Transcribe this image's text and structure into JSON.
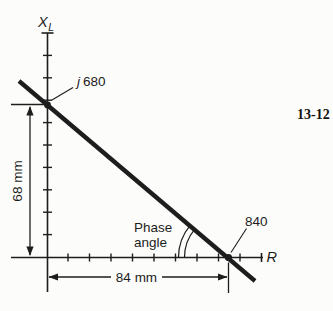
{
  "figure_number": "13-12",
  "axes": {
    "y_label_main": "X",
    "y_label_sub": "L",
    "x_label": "R"
  },
  "points": {
    "reactance_prefix": "j",
    "reactance_value": "680",
    "resistance_value": "840"
  },
  "annotations": {
    "phase_line1": "Phase",
    "phase_line2": "angle"
  },
  "dimensions": {
    "vertical": "68 mm",
    "horizontal": "84 mm"
  },
  "colors": {
    "ink": "#1d1d1d",
    "background": "#fcfcfa"
  },
  "diagram": {
    "type": "impedance-phasor",
    "reactance_ohms": 680,
    "resistance_ohms": 840,
    "vertical_scale_mm": 68,
    "horizontal_scale_mm": 84,
    "angle_name": "Phase angle"
  }
}
